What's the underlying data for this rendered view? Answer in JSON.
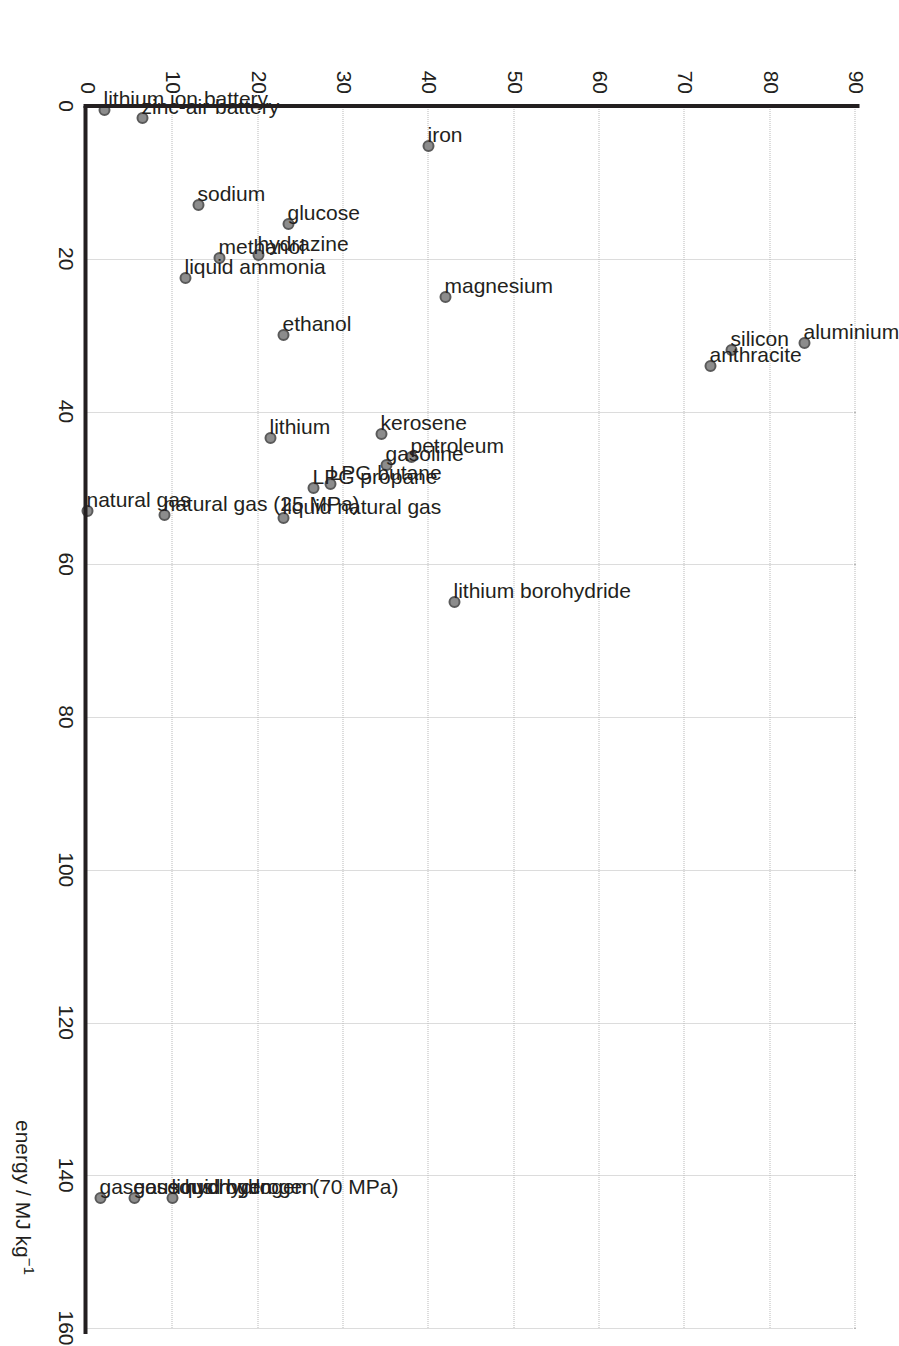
{
  "chart_data": {
    "type": "scatter",
    "title": "",
    "xlabel": "energy / MJ kg⁻¹",
    "ylabel": "energy / MJ l⁻¹",
    "xlim": [
      0,
      160
    ],
    "ylim": [
      0,
      90
    ],
    "xticks": [
      0,
      20,
      40,
      60,
      80,
      100,
      120,
      140,
      160
    ],
    "yticks": [
      0,
      10,
      20,
      30,
      40,
      50,
      60,
      70,
      80,
      90
    ],
    "grid": true,
    "legend": "none",
    "points": [
      {
        "label": "aluminium",
        "x": 31,
        "y": 84
      },
      {
        "label": "silicon",
        "x": 32,
        "y": 75.5
      },
      {
        "label": "anthracite",
        "x": 34,
        "y": 73
      },
      {
        "label": "lithium borohydride",
        "x": 65,
        "y": 43
      },
      {
        "label": "magnesium",
        "x": 25,
        "y": 42
      },
      {
        "label": "petroleum",
        "x": 46,
        "y": 38
      },
      {
        "label": "gasoline",
        "x": 47,
        "y": 35
      },
      {
        "label": "kerosene",
        "x": 43,
        "y": 34.5
      },
      {
        "label": "LPG butane",
        "x": 49.5,
        "y": 28.5
      },
      {
        "label": "LPG propane",
        "x": 50,
        "y": 26.5
      },
      {
        "label": "liquid natural gas",
        "x": 54,
        "y": 23
      },
      {
        "label": "ethanol",
        "x": 30,
        "y": 23
      },
      {
        "label": "lithium",
        "x": 43.5,
        "y": 21.5
      },
      {
        "label": "glucose",
        "x": 15.5,
        "y": 23.5
      },
      {
        "label": "hydrazine",
        "x": 19.5,
        "y": 20
      },
      {
        "label": "methanol",
        "x": 19.9,
        "y": 15.5
      },
      {
        "label": "liquid ammonia",
        "x": 22.5,
        "y": 11.5
      },
      {
        "label": "sodium",
        "x": 13,
        "y": 13
      },
      {
        "label": "iron",
        "x": 5.2,
        "y": 40
      },
      {
        "label": "natural gas (25 MPa)",
        "x": 53.6,
        "y": 9
      },
      {
        "label": "zinc-air battery",
        "x": 1.6,
        "y": 6.5
      },
      {
        "label": "lithium ion battery",
        "x": 0.5,
        "y": 2
      },
      {
        "label": "natural gas",
        "x": 53,
        "y": 0
      },
      {
        "label": "liquid hydrogen",
        "x": 143,
        "y": 10
      },
      {
        "label": "gaseous hydrogen (70 MPa)",
        "x": 143,
        "y": 5.5
      },
      {
        "label": "gaseous hydrogen",
        "x": 143,
        "y": 1.5
      }
    ]
  },
  "axes": {
    "x_title": "energy / MJ kg",
    "x_title_exp": "−1",
    "y_title": "energy / MJ l",
    "y_title_exp": "−1"
  },
  "colors": {
    "marker_fill": "#8c8c8c",
    "marker_stroke": "#5a5a5a",
    "axis": "#231f20",
    "grid": "#b9b9b9",
    "text": "#231f20",
    "background": "#ffffff"
  }
}
